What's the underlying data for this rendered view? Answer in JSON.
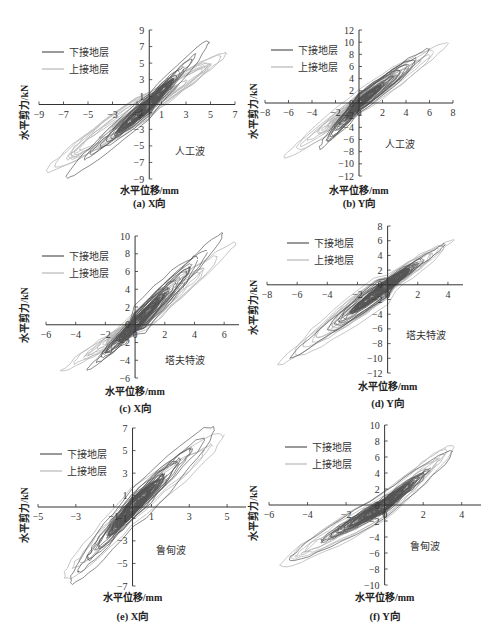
{
  "legend": {
    "lower": {
      "label": "下接地层",
      "color": "#555555"
    },
    "upper": {
      "label": "上接地层",
      "color": "#b8b8b8"
    }
  },
  "axis_labels": {
    "x": "水平位移/mm",
    "y": "水平剪力/kN"
  },
  "chart_data": [
    {
      "type": "line",
      "id": "a",
      "caption": "(a) X向",
      "annotation": "人工波",
      "title": "",
      "xlabel": "水平位移/mm",
      "ylabel": "水平剪力/kN",
      "xlim": [
        -9,
        7
      ],
      "ylim": [
        -9,
        9
      ],
      "xticks": [
        -9,
        -7,
        -5,
        -3,
        -1,
        1,
        3,
        5,
        7
      ],
      "yticks": [
        -9,
        -7,
        -5,
        -3,
        -1,
        1,
        3,
        5,
        7,
        9
      ],
      "legend_position": "upper-left",
      "grid": false,
      "series": [
        {
          "name": "下接地层",
          "peak_pos": [
            4.9,
            7.6
          ],
          "peak_neg": [
            -6.8,
            -8.6
          ],
          "x_range": [
            -6.8,
            4.9
          ],
          "y_range": [
            -8.6,
            7.6
          ]
        },
        {
          "name": "上接地层",
          "peak_pos": [
            6.3,
            6.1
          ],
          "peak_neg": [
            -8.4,
            -8.1
          ],
          "x_range": [
            -8.4,
            6.3
          ],
          "y_range": [
            -8.1,
            8.4
          ]
        }
      ]
    },
    {
      "type": "line",
      "id": "b",
      "caption": "(b) Y向",
      "annotation": "人工波",
      "title": "",
      "xlabel": "水平位移/mm",
      "ylabel": "水平剪力/kN",
      "xlim": [
        -8,
        8
      ],
      "ylim": [
        -12,
        12
      ],
      "xticks": [
        -8,
        -6,
        -4,
        -2,
        0,
        2,
        4,
        6,
        8
      ],
      "yticks": [
        -12,
        -10,
        -8,
        -6,
        -4,
        -2,
        0,
        2,
        4,
        6,
        8,
        10,
        12
      ],
      "legend_position": "upper-left",
      "grid": false,
      "series": [
        {
          "name": "下接地层",
          "peak_pos": [
            6.0,
            8.8
          ],
          "peak_neg": [
            -3.4,
            -7.5
          ],
          "x_range": [
            -3.4,
            6.0
          ],
          "y_range": [
            -7.5,
            8.8
          ]
        },
        {
          "name": "上接地层",
          "peak_pos": [
            7.6,
            9.9
          ],
          "peak_neg": [
            -6.4,
            -9.0
          ],
          "x_range": [
            -6.4,
            7.6
          ],
          "y_range": [
            -9.0,
            9.9
          ]
        }
      ]
    },
    {
      "type": "line",
      "id": "c",
      "caption": "(c) X向",
      "annotation": "塔夫特波",
      "title": "",
      "xlabel": "水平位移/mm",
      "ylabel": "水平剪力/kN",
      "xlim": [
        -6,
        7
      ],
      "ylim": [
        -6,
        10
      ],
      "xticks": [
        -6,
        -4,
        -2,
        0,
        2,
        4,
        6
      ],
      "yticks": [
        -6,
        -4,
        -2,
        0,
        2,
        4,
        6,
        8,
        10
      ],
      "legend_position": "upper-left",
      "grid": false,
      "series": [
        {
          "name": "下接地层",
          "peak_pos": [
            5.9,
            10.3
          ],
          "peak_neg": [
            -3.2,
            -5.0
          ],
          "x_range": [
            -3.2,
            5.9
          ],
          "y_range": [
            -5.0,
            10.3
          ]
        },
        {
          "name": "上接地层",
          "peak_pos": [
            6.8,
            9.2
          ],
          "peak_neg": [
            -5.0,
            -5.3
          ],
          "x_range": [
            -5.0,
            6.8
          ],
          "y_range": [
            -5.3,
            9.2
          ]
        }
      ]
    },
    {
      "type": "line",
      "id": "d",
      "caption": "(d) Y向",
      "annotation": "塔夫特波",
      "title": "",
      "xlabel": "水平位移/mm",
      "ylabel": "水平剪力/kN",
      "xlim": [
        -8,
        5
      ],
      "ylim": [
        -12,
        8
      ],
      "xticks": [
        -8,
        -6,
        -4,
        -2,
        0,
        2,
        4
      ],
      "yticks": [
        -12,
        -10,
        -8,
        -6,
        -4,
        -2,
        0,
        2,
        4,
        6,
        8
      ],
      "legend_position": "upper-left",
      "grid": false,
      "series": [
        {
          "name": "下接地层",
          "peak_pos": [
            3.8,
            5.5
          ],
          "peak_neg": [
            -6.5,
            -10.0
          ],
          "x_range": [
            -6.5,
            3.8
          ],
          "y_range": [
            -10.0,
            5.5
          ]
        },
        {
          "name": "上接地层",
          "peak_pos": [
            4.4,
            6.3
          ],
          "peak_neg": [
            -7.3,
            -10.8
          ],
          "x_range": [
            -7.3,
            4.4
          ],
          "y_range": [
            -10.8,
            6.3
          ]
        }
      ]
    },
    {
      "type": "line",
      "id": "e",
      "caption": "(e) X向",
      "annotation": "鲁甸波",
      "title": "",
      "xlabel": "水平位移/mm",
      "ylabel": "水平剪力/kN",
      "xlim": [
        -5,
        6
      ],
      "ylim": [
        -7,
        7
      ],
      "xticks": [
        -5,
        -3,
        -1,
        1,
        3,
        5
      ],
      "yticks": [
        -7,
        -5,
        -3,
        -1,
        1,
        3,
        5,
        7
      ],
      "legend_position": "upper-left",
      "grid": false,
      "series": [
        {
          "name": "下接地层",
          "peak_pos": [
            4.3,
            7.0
          ],
          "peak_neg": [
            -3.3,
            -6.4
          ],
          "x_range": [
            -3.3,
            4.3
          ],
          "y_range": [
            -6.4,
            7.0
          ]
        },
        {
          "name": "上接地层",
          "peak_pos": [
            4.8,
            6.3
          ],
          "peak_neg": [
            -3.6,
            -6.2
          ],
          "x_range": [
            -3.6,
            4.8
          ],
          "y_range": [
            -6.2,
            6.3
          ]
        }
      ]
    },
    {
      "type": "line",
      "id": "f",
      "caption": "(f) Y向",
      "annotation": "鲁甸波",
      "title": "",
      "xlabel": "水平位移/mm",
      "ylabel": "水平剪力/kN",
      "xlim": [
        -6,
        5
      ],
      "ylim": [
        -10,
        10
      ],
      "xticks": [
        -6,
        -4,
        -2,
        0,
        2,
        4
      ],
      "yticks": [
        -10,
        -8,
        -6,
        -4,
        -2,
        0,
        2,
        4,
        6,
        8,
        10
      ],
      "legend_position": "upper-left",
      "grid": false,
      "series": [
        {
          "name": "下接地层",
          "peak_pos": [
            3.5,
            6.6
          ],
          "peak_neg": [
            -4.9,
            -6.8
          ],
          "x_range": [
            -4.9,
            3.5
          ],
          "y_range": [
            -6.8,
            6.6
          ]
        },
        {
          "name": "上接地层",
          "peak_pos": [
            3.6,
            7.4
          ],
          "peak_neg": [
            -5.4,
            -7.4
          ],
          "x_range": [
            -5.4,
            3.6
          ],
          "y_range": [
            -7.4,
            7.4
          ]
        }
      ]
    }
  ],
  "layout": [
    {
      "id": "a",
      "left": 0,
      "top": 0,
      "w": 250,
      "h": 212,
      "ox": 150,
      "ax_left": 39,
      "ax_right": 235,
      "ax_top": 30,
      "ax_bottom": 179,
      "xaxis_y": 104,
      "yaxis_x": 150,
      "leg_x": 42,
      "leg_y": 52,
      "wave_x": 175,
      "wave_y": 155,
      "xlab_y": 196,
      "cap_y": 208
    },
    {
      "id": "b",
      "left": 245,
      "top": 0,
      "w": 248,
      "h": 212,
      "ax_left": 265,
      "ax_right": 452,
      "ax_top": 30,
      "ax_bottom": 176,
      "xaxis_y": 102,
      "yaxis_x": 358,
      "leg_x": 272,
      "leg_y": 52,
      "wave_x": 380,
      "wave_y": 148,
      "xlab_y": 196,
      "cap_y": 208
    }
  ]
}
